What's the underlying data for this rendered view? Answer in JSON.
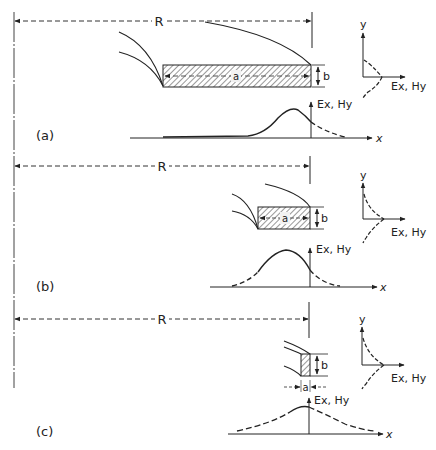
{
  "figure": {
    "colors": {
      "ink": "#222222",
      "background": "#ffffff"
    },
    "panels": [
      {
        "id": "a",
        "label": "(a)",
        "radius_label": "R",
        "width_label": "a",
        "height_label": "b",
        "field_label": "Ex, Hy",
        "x_axis_label": "x",
        "y_axis_label": "y",
        "transverse_field_label": "Ex, Hy"
      },
      {
        "id": "b",
        "label": "(b)",
        "radius_label": "R",
        "width_label": "a",
        "height_label": "b",
        "field_label": "Ex, Hy",
        "x_axis_label": "x",
        "y_axis_label": "y",
        "transverse_field_label": "Ex, Hy"
      },
      {
        "id": "c",
        "label": "(c)",
        "radius_label": "R",
        "width_label": "a",
        "height_label": "b",
        "field_label": "Ex, Hy",
        "x_axis_label": "x",
        "y_axis_label": "y",
        "transverse_field_label": "Ex, Hy"
      }
    ]
  }
}
